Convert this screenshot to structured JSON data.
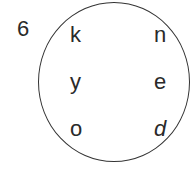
{
  "problem_number": "6",
  "letters": [
    {
      "id": "k",
      "text": "k",
      "italic": false
    },
    {
      "id": "n",
      "text": "n",
      "italic": false
    },
    {
      "id": "y",
      "text": "y",
      "italic": false
    },
    {
      "id": "e",
      "text": "e",
      "italic": false
    },
    {
      "id": "o",
      "text": "o",
      "italic": false
    },
    {
      "id": "d",
      "text": "d",
      "italic": true
    }
  ]
}
